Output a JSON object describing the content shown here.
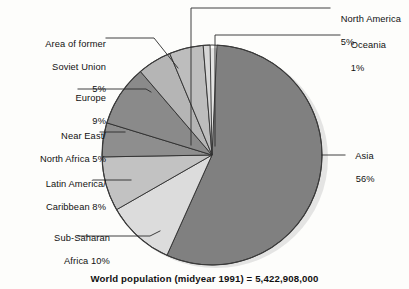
{
  "caption": "World population (midyear 1991) = 5,422,908,000",
  "chart_data": {
    "type": "pie",
    "title": "World population (midyear 1991) = 5,422,908,000",
    "unit": "percent",
    "total_population": "5,422,908,000",
    "year": "midyear 1991",
    "legend_position": "leader-lines",
    "categories": [
      "Asia",
      "Sub-Saharan Africa",
      "Latin America/Caribbean",
      "Near East/North Africa",
      "Europe",
      "Area of former Soviet Union",
      "North America",
      "Oceania"
    ],
    "values": [
      56,
      10,
      8,
      5,
      9,
      5,
      5,
      1
    ],
    "slices": [
      {
        "name": "Asia",
        "label_line1": "Asia",
        "label_line2": "56%",
        "value": 56,
        "value_text": "56%",
        "color": "#808080",
        "start_deg": 2.6,
        "sweep_deg": 201.6,
        "label_side": "right"
      },
      {
        "name": "Sub-Saharan Africa",
        "label_line1": "Sub-Saharan",
        "label_line2": "Africa 10%",
        "value": 10,
        "value_text": "10%",
        "color": "#dcdcdc",
        "start_deg": 204.2,
        "sweep_deg": 36.0,
        "label_side": "left"
      },
      {
        "name": "Latin America/Caribbean",
        "label_line1": "Latin America/",
        "label_line2": "Caribbean 8%",
        "value": 8,
        "value_text": "8%",
        "color": "#c2c2c2",
        "start_deg": 240.2,
        "sweep_deg": 28.8,
        "label_side": "left"
      },
      {
        "name": "Near East/North Africa",
        "label_line1": "Near East/",
        "label_line2": "North Africa 5%",
        "value": 5,
        "value_text": "5%",
        "color": "#8e8e8e",
        "start_deg": 269.0,
        "sweep_deg": 18.0,
        "label_side": "left"
      },
      {
        "name": "Europe",
        "label_line1": "Europe",
        "label_line2": "9%",
        "value": 9,
        "value_text": "9%",
        "color": "#8a8a8a",
        "start_deg": 287.0,
        "sweep_deg": 32.4,
        "label_side": "left"
      },
      {
        "name": "Area of former Soviet Union",
        "label_line1": "Area of former",
        "label_line2": "Soviet Union",
        "label_line3": "5%",
        "value": 5,
        "value_text": "5%",
        "color": "#b5b5b5",
        "start_deg": 319.4,
        "sweep_deg": 18.0,
        "label_side": "left"
      },
      {
        "name": "North America",
        "label_line1": "North America",
        "label_line2": "5%",
        "value": 5,
        "value_text": "5%",
        "color": "#bdbdbd",
        "start_deg": 337.4,
        "sweep_deg": 18.0,
        "label_side": "right"
      },
      {
        "name": "Oceania",
        "label_line1": "Oceania",
        "label_line2": "1%",
        "value": 1,
        "value_text": "1%",
        "color": "#d6d6d6",
        "start_deg": 355.4,
        "sweep_deg": 3.6,
        "label_side": "right"
      }
    ]
  }
}
